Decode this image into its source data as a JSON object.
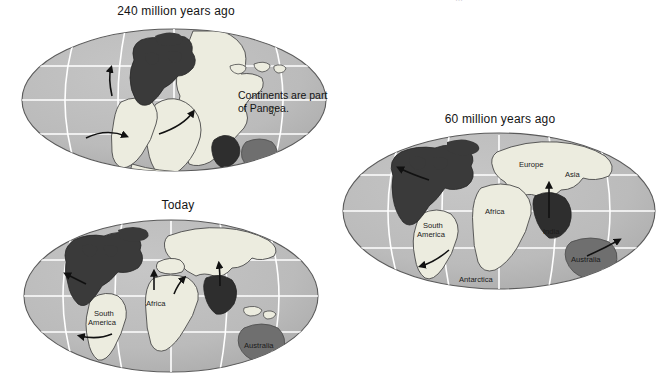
{
  "figure": {
    "kind": "continental-drift-diagram",
    "background": "#ffffff",
    "cut_header_text": "…",
    "palette": {
      "ocean": "#b9b9b9",
      "ocean_shadow": "#a7a7a7",
      "graticule": "#ffffff",
      "outline": "#4a4a4a",
      "land_light": "#ececdf",
      "land_dark": "#3a3a3a",
      "land_mid": "#6f6f6f",
      "text": "#141414",
      "arrow": "#111111"
    }
  },
  "maps": [
    {
      "id": "map-240mya",
      "title": "240 million years ago",
      "callout": [
        "Continents are part",
        "of Pangea."
      ],
      "labels": [],
      "arrows": 3
    },
    {
      "id": "map-today",
      "title": "Today",
      "callout": [],
      "labels": [
        {
          "name": "South America",
          "lines": [
            "South",
            "America"
          ]
        },
        {
          "name": "Africa",
          "lines": [
            "Africa"
          ]
        },
        {
          "name": "Australia",
          "lines": [
            "Australia"
          ]
        }
      ],
      "arrows": 5
    },
    {
      "id": "map-60mya",
      "title": "60 million years ago",
      "callout": [],
      "labels": [
        {
          "name": "Europe",
          "lines": [
            "Europe"
          ]
        },
        {
          "name": "Asia",
          "lines": [
            "Asia"
          ]
        },
        {
          "name": "Africa",
          "lines": [
            "Africa"
          ]
        },
        {
          "name": "India",
          "lines": [
            "India"
          ]
        },
        {
          "name": "South America",
          "lines": [
            "South",
            "America"
          ]
        },
        {
          "name": "Australia",
          "lines": [
            "Australia"
          ]
        },
        {
          "name": "Antarctica",
          "lines": [
            "Antarctica"
          ]
        }
      ],
      "arrows": 4
    }
  ]
}
